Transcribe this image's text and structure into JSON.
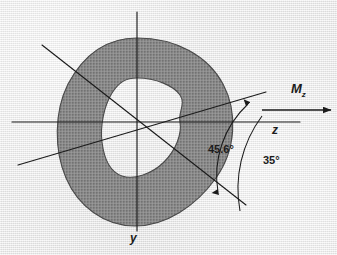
{
  "figure": {
    "name": "beam-cross-section-principal-axes-diagram",
    "type": "engineering-cross-section-diagram",
    "background_color": "#e8e8e8",
    "section_fill_color": "#8a8a8a",
    "hole_fill_color": "#f4f4f4",
    "line_color": "#1b1b1b"
  },
  "labels": {
    "moment": "M",
    "moment_subscript": "z",
    "z_axis": "z",
    "y_axis": "y",
    "angle_principal": "45.6°",
    "angle_moment": "35°"
  },
  "geometry": {
    "origin": {
      "x": 137,
      "y": 122
    },
    "outer_section": {
      "description": "closed rounded teardrop / egg-shaped outer boundary",
      "path": "M 137,38 C 176,38 208,56 223,84 C 238,112 236,150 216,178 C 196,206 166,226 135,226 C 104,226 78,206 66,178 C 54,150 54,112 68,84 C 83,56 104,38 137,38 Z"
    },
    "inner_hole": {
      "description": "rounded triangular hollow core",
      "path": "M 137,78 C 156,78 174,86 180,95 C 186,104 178,112 180,122 C 182,134 176,150 164,162 C 152,174 134,180 122,176 C 110,172 104,158 102,142 C 100,126 104,106 112,93 C 119,82 126,78 137,78 Z"
    },
    "axes": [
      {
        "name": "y-axis-vertical",
        "x1": 137,
        "y1": 12,
        "x2": 137,
        "y2": 231
      },
      {
        "name": "z-axis-horizontal",
        "x1": 12,
        "y1": 122,
        "x2": 300,
        "y2": 122
      },
      {
        "name": "principal-axis-1",
        "angle_deg": -35,
        "x1": 18,
        "y1": 165,
        "x2": 266,
        "y2": 92
      },
      {
        "name": "principal-axis-2",
        "angle_deg": 45.6,
        "x1": 42,
        "y1": 45,
        "x2": 246,
        "y2": 205
      }
    ],
    "moment_arrow": {
      "x1": 262,
      "y1": 110,
      "x2": 331,
      "y2": 110,
      "direction": "right"
    },
    "angle_arc_principal": {
      "label": "45.6°",
      "from_axis": "principal-axis-2",
      "to_axis": "principal-axis-1",
      "radius": 98
    },
    "angle_arc_moment": {
      "label": "35°",
      "from_axis": "principal-axis-2",
      "to_axis": "z-axis-horizontal",
      "radius": 122
    }
  }
}
